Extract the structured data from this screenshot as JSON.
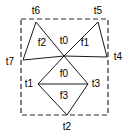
{
  "diagram": {
    "canvas": {
      "width": 129,
      "height": 137
    },
    "colors": {
      "background": "#ffffff",
      "edge": "#1a1a1a",
      "boundary": "#2b2b2b",
      "label": "#000000"
    },
    "boundary": {
      "name": "dashed-bounding-box",
      "x": 21,
      "y": 19,
      "width": 87,
      "height": 96,
      "style": "dashed"
    },
    "vertices": [
      {
        "id": "t0",
        "label": "t0",
        "x": 64,
        "y": 56,
        "label_x": 64,
        "label_y": 41
      },
      {
        "id": "t1",
        "label": "t1",
        "x": 38,
        "y": 84,
        "label_x": 29,
        "label_y": 84
      },
      {
        "id": "t2",
        "label": "t2",
        "x": 67,
        "y": 115,
        "label_x": 67,
        "label_y": 127
      },
      {
        "id": "t3",
        "label": "t3",
        "x": 88,
        "y": 84,
        "label_x": 96,
        "label_y": 84
      },
      {
        "id": "t4",
        "label": "t4",
        "x": 107,
        "y": 57,
        "label_x": 118,
        "label_y": 57
      },
      {
        "id": "t5",
        "label": "t5",
        "x": 98,
        "y": 22,
        "label_x": 98,
        "label_y": 11
      },
      {
        "id": "t6",
        "label": "t6",
        "x": 36,
        "y": 22,
        "label_x": 36,
        "label_y": 11
      },
      {
        "id": "t7",
        "label": "t7",
        "x": 23,
        "y": 60,
        "label_x": 10,
        "label_y": 62
      }
    ],
    "edges": [
      {
        "from": "t6",
        "to": "t0"
      },
      {
        "from": "t6",
        "to": "t7"
      },
      {
        "from": "t7",
        "to": "t0"
      },
      {
        "from": "t5",
        "to": "t0"
      },
      {
        "from": "t5",
        "to": "t4"
      },
      {
        "from": "t4",
        "to": "t0"
      },
      {
        "from": "t0",
        "to": "t1"
      },
      {
        "from": "t0",
        "to": "t3"
      },
      {
        "from": "t1",
        "to": "t3"
      },
      {
        "from": "t1",
        "to": "t2"
      },
      {
        "from": "t3",
        "to": "t2"
      }
    ],
    "faces": [
      {
        "id": "f0",
        "label": "f0",
        "label_x": 64,
        "label_y": 74
      },
      {
        "id": "f1",
        "label": "f1",
        "label_x": 85,
        "label_y": 43
      },
      {
        "id": "f2",
        "label": "f2",
        "label_x": 42,
        "label_y": 43
      },
      {
        "id": "f3",
        "label": "f3",
        "label_x": 64,
        "label_y": 96
      }
    ]
  }
}
